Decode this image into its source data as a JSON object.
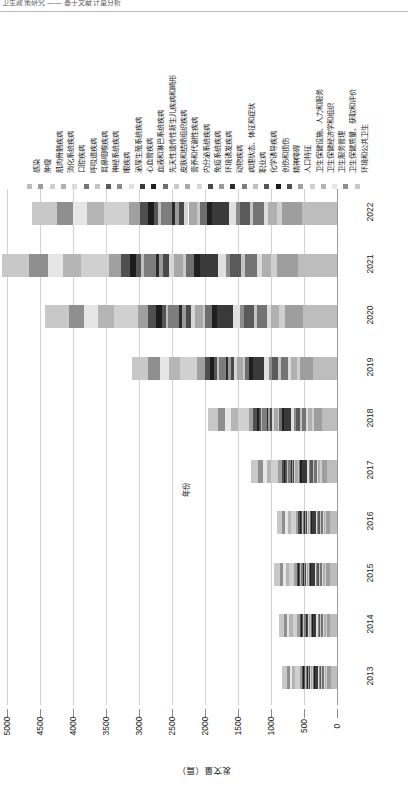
{
  "header": {
    "text": "卫生政策研究 —— 基于文献计量分析"
  },
  "chart_data": {
    "type": "bar",
    "orientation": "horizontal-stacked-rotated",
    "title": "",
    "xlabel": "发文量（篇）",
    "ylabel": "年份",
    "xlim": [
      0,
      5000
    ],
    "xticks": [
      "5000",
      "4500",
      "4000",
      "3500",
      "3000",
      "2500",
      "2000",
      "1500",
      "1000",
      "500",
      "0"
    ],
    "xtick_values": [
      5000,
      4500,
      4000,
      3500,
      3000,
      2500,
      2000,
      1500,
      1000,
      500,
      0
    ],
    "grid": true,
    "legend_position": "top",
    "categories": [
      "2013",
      "2014",
      "2015",
      "2016",
      "2017",
      "2018",
      "2019",
      "2020",
      "2021",
      "2022"
    ],
    "totals": [
      760,
      800,
      860,
      830,
      1180,
      1780,
      2830,
      4030,
      4620,
      4210
    ],
    "series": [
      {
        "name": "感染",
        "color": "#bdbdbd",
        "values": [
          96,
          101,
          109,
          105,
          149,
          225,
          358,
          510,
          585,
          533
        ]
      },
      {
        "name": "肿瘤",
        "color": "#9e9e9e",
        "values": [
          53,
          56,
          60,
          58,
          83,
          125,
          198,
          282,
          323,
          295
        ]
      },
      {
        "name": "肌肉骨骼疾病",
        "color": "#cfcfcf",
        "values": [
          15,
          16,
          17,
          17,
          24,
          36,
          57,
          81,
          92,
          84
        ]
      },
      {
        "name": "消化系统疾病",
        "color": "#b0b0b0",
        "values": [
          23,
          24,
          26,
          25,
          35,
          53,
          85,
          121,
          139,
          126
        ]
      },
      {
        "name": "口腔疾病",
        "color": "#dcdcdc",
        "values": [
          11,
          12,
          13,
          12,
          18,
          27,
          42,
          60,
          69,
          63
        ]
      },
      {
        "name": "呼吸道疾病",
        "color": "#747474",
        "values": [
          30,
          32,
          34,
          33,
          47,
          71,
          113,
          161,
          185,
          168
        ]
      },
      {
        "name": "耳鼻咽喉疾病",
        "color": "#c4c4c4",
        "values": [
          9,
          10,
          10,
          10,
          14,
          21,
          34,
          48,
          55,
          51
        ]
      },
      {
        "name": "神经系统疾病",
        "color": "#5a5a5a",
        "values": [
          27,
          29,
          31,
          30,
          42,
          64,
          102,
          145,
          166,
          152
        ]
      },
      {
        "name": "眼疾病",
        "color": "#8c8c8c",
        "values": [
          11,
          12,
          13,
          12,
          18,
          27,
          42,
          60,
          69,
          63
        ]
      },
      {
        "name": "泌尿生殖系统疾病",
        "color": "#e0e0e0",
        "values": [
          19,
          20,
          22,
          21,
          30,
          45,
          71,
          101,
          116,
          105
        ]
      },
      {
        "name": "心血管疾病",
        "color": "#3a3a3a",
        "values": [
          45,
          48,
          52,
          50,
          71,
          107,
          170,
          242,
          277,
          253
        ]
      },
      {
        "name": "血液和淋巴系统疾病",
        "color": "#1f1f1f",
        "values": [
          15,
          16,
          17,
          17,
          24,
          36,
          57,
          81,
          92,
          84
        ]
      },
      {
        "name": "先天性遗传性新生儿疾病和畸形",
        "color": "#6e6e6e",
        "values": [
          19,
          20,
          22,
          21,
          30,
          45,
          71,
          101,
          116,
          105
        ]
      },
      {
        "name": "皮肤和结缔组织疾病",
        "color": "#cacaca",
        "values": [
          8,
          8,
          9,
          8,
          12,
          18,
          28,
          40,
          46,
          42
        ]
      },
      {
        "name": "营养和代谢性疾病",
        "color": "#a8a8a8",
        "values": [
          23,
          24,
          26,
          25,
          35,
          53,
          85,
          121,
          139,
          126
        ]
      },
      {
        "name": "内分泌系统疾病",
        "color": "#d6d6d6",
        "values": [
          11,
          12,
          13,
          12,
          18,
          27,
          42,
          60,
          69,
          63
        ]
      },
      {
        "name": "免疫系统疾病",
        "color": "#4a4a4a",
        "values": [
          15,
          16,
          17,
          17,
          24,
          36,
          57,
          81,
          92,
          84
        ]
      },
      {
        "name": "环境诱发疾病",
        "color": "#9a9a9a",
        "values": [
          11,
          12,
          13,
          12,
          18,
          27,
          42,
          60,
          69,
          63
        ]
      },
      {
        "name": "动物疾病",
        "color": "#2b2b2b",
        "values": [
          8,
          8,
          9,
          8,
          12,
          18,
          28,
          40,
          46,
          42
        ]
      },
      {
        "name": "病理状态、体征和症状",
        "color": "#7d7d7d",
        "values": [
          30,
          32,
          34,
          33,
          47,
          71,
          113,
          161,
          185,
          168
        ]
      },
      {
        "name": "职业病",
        "color": "#bfbfbf",
        "values": [
          8,
          8,
          9,
          8,
          12,
          18,
          28,
          40,
          46,
          42
        ]
      },
      {
        "name": "化学诱导疾病",
        "color": "#555555",
        "values": [
          11,
          12,
          13,
          12,
          18,
          27,
          42,
          60,
          69,
          63
        ]
      },
      {
        "name": "创伤和损伤",
        "color": "#1c1c1c",
        "values": [
          15,
          16,
          17,
          17,
          24,
          36,
          57,
          81,
          92,
          84
        ]
      },
      {
        "name": "精神障碍",
        "color": "#4f4f4f",
        "values": [
          23,
          24,
          26,
          25,
          35,
          53,
          85,
          121,
          139,
          126
        ]
      },
      {
        "name": "人口特征",
        "color": "#a0a0a0",
        "values": [
          30,
          32,
          34,
          33,
          47,
          71,
          113,
          161,
          185,
          168
        ]
      },
      {
        "name": "卫生保健设施、人力和服务",
        "color": "#d0d0d0",
        "values": [
          68,
          72,
          77,
          75,
          106,
          160,
          255,
          363,
          416,
          379
        ]
      },
      {
        "name": "卫生保健经济学和组织",
        "color": "#b5b5b5",
        "values": [
          45,
          48,
          52,
          50,
          71,
          107,
          170,
          242,
          277,
          253
        ]
      },
      {
        "name": "卫生服务管理",
        "color": "#e6e6e6",
        "values": [
          38,
          40,
          43,
          42,
          59,
          89,
          142,
          202,
          231,
          211
        ]
      },
      {
        "name": "卫生保健质量、获取和评价",
        "color": "#8f8f8f",
        "values": [
          45,
          48,
          52,
          50,
          71,
          107,
          170,
          242,
          277,
          253
        ]
      },
      {
        "name": "环境和公共卫生",
        "color": "#c8c8c8",
        "values": [
          68,
          72,
          77,
          75,
          106,
          160,
          255,
          363,
          416,
          379
        ]
      }
    ]
  }
}
